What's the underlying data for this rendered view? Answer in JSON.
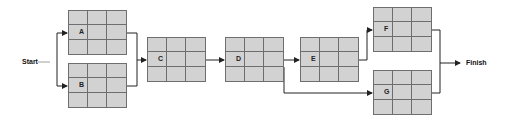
{
  "diagram": {
    "type": "network-diagram",
    "start_label": "Start",
    "finish_label": "Finish",
    "nodes": [
      {
        "id": "A",
        "label": "A",
        "x": 68,
        "y": 10
      },
      {
        "id": "B",
        "label": "B",
        "x": 68,
        "y": 63
      },
      {
        "id": "C",
        "label": "C",
        "x": 147,
        "y": 37
      },
      {
        "id": "D",
        "label": "D",
        "x": 225,
        "y": 37
      },
      {
        "id": "E",
        "label": "E",
        "x": 300,
        "y": 37
      },
      {
        "id": "F",
        "label": "F",
        "x": 373,
        "y": 7
      },
      {
        "id": "G",
        "label": "G",
        "x": 373,
        "y": 70
      }
    ],
    "edges": [
      [
        "Start",
        "A"
      ],
      [
        "Start",
        "B"
      ],
      [
        "A",
        "C"
      ],
      [
        "B",
        "C"
      ],
      [
        "C",
        "D"
      ],
      [
        "D",
        "E"
      ],
      [
        "D",
        "G"
      ],
      [
        "E",
        "F"
      ],
      [
        "F",
        "Finish"
      ],
      [
        "G",
        "Finish"
      ]
    ],
    "colors": {
      "node_fill": "#d2d2d2",
      "grid_line": "#6e6e6e",
      "edge": "#222222"
    }
  }
}
